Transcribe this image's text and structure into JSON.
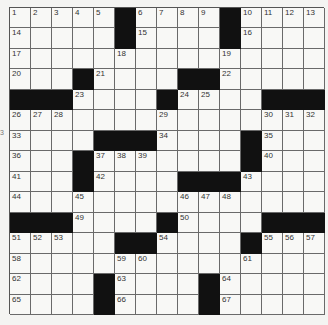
{
  "puzzle": {
    "rows": 15,
    "cols": 15,
    "layout": [
      "#####B####B####",
      "#####B####B####",
      "###############",
      "###B####BB#####",
      "BBB####B####BBB",
      "###############",
      "####BBB####B###",
      "###B#######B###",
      "###B####BBB####",
      "###############",
      "BBB####B####BBB",
      "#####BB####B###",
      "###############",
      "####B####B#####",
      "####B####B#####"
    ],
    "numbers": [
      {
        "r": 0,
        "c": 0,
        "n": "1"
      },
      {
        "r": 0,
        "c": 1,
        "n": "2"
      },
      {
        "r": 0,
        "c": 2,
        "n": "3"
      },
      {
        "r": 0,
        "c": 3,
        "n": "4"
      },
      {
        "r": 0,
        "c": 4,
        "n": "5"
      },
      {
        "r": 0,
        "c": 6,
        "n": "6"
      },
      {
        "r": 0,
        "c": 7,
        "n": "7"
      },
      {
        "r": 0,
        "c": 8,
        "n": "8"
      },
      {
        "r": 0,
        "c": 9,
        "n": "9"
      },
      {
        "r": 0,
        "c": 11,
        "n": "10"
      },
      {
        "r": 0,
        "c": 12,
        "n": "11"
      },
      {
        "r": 0,
        "c": 13,
        "n": "12"
      },
      {
        "r": 0,
        "c": 14,
        "n": "13"
      },
      {
        "r": 1,
        "c": 0,
        "n": "14"
      },
      {
        "r": 1,
        "c": 6,
        "n": "15"
      },
      {
        "r": 1,
        "c": 11,
        "n": "16"
      },
      {
        "r": 2,
        "c": 0,
        "n": "17"
      },
      {
        "r": 2,
        "c": 5,
        "n": "18"
      },
      {
        "r": 2,
        "c": 10,
        "n": "19"
      },
      {
        "r": 3,
        "c": 0,
        "n": "20"
      },
      {
        "r": 3,
        "c": 4,
        "n": "21"
      },
      {
        "r": 3,
        "c": 10,
        "n": "22"
      },
      {
        "r": 4,
        "c": 3,
        "n": "23"
      },
      {
        "r": 4,
        "c": 8,
        "n": "24"
      },
      {
        "r": 4,
        "c": 9,
        "n": "25"
      },
      {
        "r": 5,
        "c": 0,
        "n": "26"
      },
      {
        "r": 5,
        "c": 1,
        "n": "27"
      },
      {
        "r": 5,
        "c": 2,
        "n": "28"
      },
      {
        "r": 5,
        "c": 7,
        "n": "29"
      },
      {
        "r": 5,
        "c": 12,
        "n": "30"
      },
      {
        "r": 5,
        "c": 13,
        "n": "31"
      },
      {
        "r": 5,
        "c": 14,
        "n": "32"
      },
      {
        "r": 6,
        "c": 0,
        "n": "33"
      },
      {
        "r": 6,
        "c": 7,
        "n": "34"
      },
      {
        "r": 6,
        "c": 12,
        "n": "35"
      },
      {
        "r": 7,
        "c": 0,
        "n": "36"
      },
      {
        "r": 7,
        "c": 4,
        "n": "37"
      },
      {
        "r": 7,
        "c": 5,
        "n": "38"
      },
      {
        "r": 7,
        "c": 6,
        "n": "39"
      },
      {
        "r": 7,
        "c": 12,
        "n": "40"
      },
      {
        "r": 8,
        "c": 0,
        "n": "41"
      },
      {
        "r": 8,
        "c": 4,
        "n": "42"
      },
      {
        "r": 8,
        "c": 11,
        "n": "43"
      },
      {
        "r": 9,
        "c": 0,
        "n": "44"
      },
      {
        "r": 9,
        "c": 3,
        "n": "45"
      },
      {
        "r": 9,
        "c": 8,
        "n": "46"
      },
      {
        "r": 9,
        "c": 9,
        "n": "47"
      },
      {
        "r": 9,
        "c": 10,
        "n": "48"
      },
      {
        "r": 10,
        "c": 3,
        "n": "49"
      },
      {
        "r": 10,
        "c": 8,
        "n": "50"
      },
      {
        "r": 11,
        "c": 0,
        "n": "51"
      },
      {
        "r": 11,
        "c": 1,
        "n": "52"
      },
      {
        "r": 11,
        "c": 2,
        "n": "53"
      },
      {
        "r": 11,
        "c": 7,
        "n": "54"
      },
      {
        "r": 11,
        "c": 12,
        "n": "55"
      },
      {
        "r": 11,
        "c": 13,
        "n": "56"
      },
      {
        "r": 11,
        "c": 14,
        "n": "57"
      },
      {
        "r": 12,
        "c": 0,
        "n": "58"
      },
      {
        "r": 12,
        "c": 5,
        "n": "59"
      },
      {
        "r": 12,
        "c": 6,
        "n": "60"
      },
      {
        "r": 12,
        "c": 11,
        "n": "61"
      },
      {
        "r": 13,
        "c": 0,
        "n": "62"
      },
      {
        "r": 13,
        "c": 5,
        "n": "63"
      },
      {
        "r": 13,
        "c": 10,
        "n": "64"
      },
      {
        "r": 14,
        "c": 0,
        "n": "65"
      },
      {
        "r": 14,
        "c": 5,
        "n": "66"
      },
      {
        "r": 14,
        "c": 10,
        "n": "67"
      }
    ]
  },
  "edge_mark": "3",
  "colors": {
    "black_square": "#111111",
    "grid_line": "#6a6a6a",
    "background": "#f4f4f2"
  }
}
